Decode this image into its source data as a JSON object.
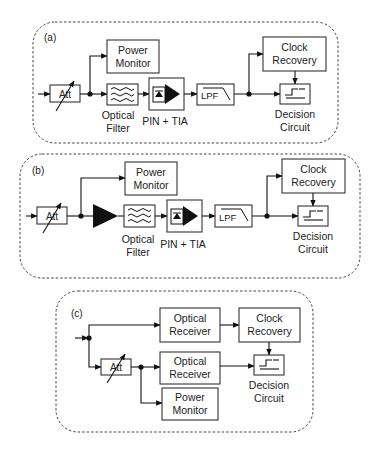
{
  "panels": [
    {
      "id": "a",
      "label": "(a)",
      "blocks": {
        "att": "Att",
        "power_monitor": [
          "Power",
          "Monitor"
        ],
        "optical_filter": [
          "Optical",
          "Filter"
        ],
        "pin_tia": "PIN + TIA",
        "lpf": "LPF",
        "clock_recovery": [
          "Clock",
          "Recovery"
        ],
        "decision_circuit": [
          "Decision",
          "Circuit"
        ]
      }
    },
    {
      "id": "b",
      "label": "(b)",
      "blocks": {
        "att": "Att",
        "optical_amplifier": "",
        "power_monitor": [
          "Power",
          "Monitor"
        ],
        "optical_filter": [
          "Optical",
          "Filter"
        ],
        "pin_tia": "PIN + TIA",
        "lpf": "LPF",
        "clock_recovery": [
          "Clock",
          "Recovery"
        ],
        "decision_circuit": [
          "Decision",
          "Circuit"
        ]
      }
    },
    {
      "id": "c",
      "label": "(c)",
      "blocks": {
        "att": "Att",
        "optical_receiver_top": [
          "Optical",
          "Receiver"
        ],
        "optical_receiver_bottom": [
          "Optical",
          "Receiver"
        ],
        "power_monitor": [
          "Power",
          "Monitor"
        ],
        "clock_recovery": [
          "Clock",
          "Recovery"
        ],
        "decision_circuit": [
          "Decision",
          "Circuit"
        ]
      }
    }
  ],
  "colors": {
    "line": "#111111",
    "box": "#333333",
    "background": "#ffffff"
  }
}
